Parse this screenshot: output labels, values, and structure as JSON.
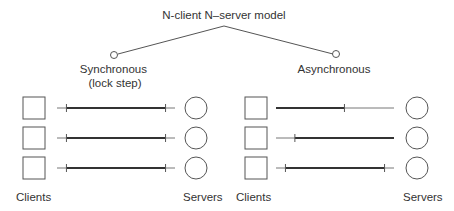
{
  "title": "N-client N–server model",
  "branches": [
    {
      "label_lines": [
        "Synchronous",
        "(lock step)"
      ]
    },
    {
      "label_lines": [
        "Asynchronous"
      ]
    }
  ],
  "panels": [
    {
      "name": "synchronous",
      "clients_label": "Clients",
      "servers_label": "Servers",
      "rows": [
        {
          "thick_from": 0.08,
          "thick_to": 0.92
        },
        {
          "thick_from": 0.08,
          "thick_to": 0.92
        },
        {
          "thick_from": 0.08,
          "thick_to": 0.92
        }
      ]
    },
    {
      "name": "asynchronous",
      "clients_label": "Clients",
      "servers_label": "Servers",
      "rows": [
        {
          "thick_from": 0.0,
          "thick_to": 0.58
        },
        {
          "thick_from": 0.16,
          "thick_to": 1.0
        },
        {
          "thick_from": 0.08,
          "thick_to": 0.92
        }
      ]
    }
  ],
  "colors": {
    "stroke": "#555555",
    "thick": "#333333",
    "text": "#333333"
  }
}
